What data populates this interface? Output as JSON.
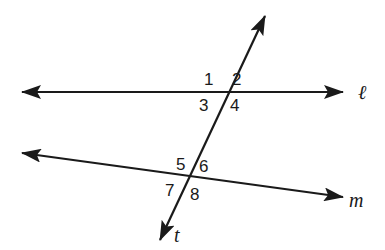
{
  "diagram": {
    "type": "parallel lines cut by a transversal",
    "lines": [
      {
        "id": "l",
        "label": "ℓ",
        "from": [
          20,
          92
        ],
        "to": [
          345,
          92
        ]
      },
      {
        "id": "m",
        "label": "m",
        "from": [
          20,
          153
        ],
        "to": [
          345,
          197
        ]
      },
      {
        "id": "t",
        "label": "t",
        "from": [
          265,
          15
        ],
        "to": [
          160,
          241
        ]
      }
    ],
    "angle_labels": {
      "a1": "1",
      "a2": "2",
      "a3": "3",
      "a4": "4",
      "a5": "5",
      "a6": "6",
      "a7": "7",
      "a8": "8"
    },
    "line_labels": {
      "l": "ℓ",
      "m": "m",
      "t": "t"
    },
    "colors": {
      "stroke": "#1a1a1a",
      "background": "#ffffff"
    }
  }
}
